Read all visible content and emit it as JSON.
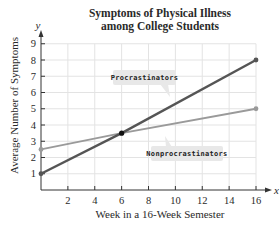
{
  "chart_data": {
    "type": "line",
    "title": "Symptoms of Physical Illness among College Students",
    "title_lines": [
      "Symptoms of Physical Illness",
      "among College Students"
    ],
    "xlabel": "Week in a 16-Week Semester",
    "ylabel": "Average Number of Symptoms",
    "x_axis_var": "x",
    "y_axis_var": "y",
    "xlim": [
      0,
      16
    ],
    "ylim": [
      0,
      9
    ],
    "x_ticks": [
      2,
      4,
      6,
      8,
      10,
      12,
      14,
      16
    ],
    "y_ticks": [
      1,
      2,
      3,
      4,
      5,
      6,
      7,
      8,
      9
    ],
    "grid": true,
    "legend_position": "inline labels",
    "series": [
      {
        "name": "Procrastinators",
        "color": "#555555",
        "x": [
          0,
          6,
          16
        ],
        "y": [
          1,
          3.5,
          8
        ],
        "endpoints": [
          [
            0,
            1
          ],
          [
            16,
            8
          ]
        ]
      },
      {
        "name": "Nonprocrastinators",
        "color": "#9a9a9a",
        "x": [
          0,
          6,
          16
        ],
        "y": [
          2.5,
          3.5,
          5
        ],
        "endpoints": [
          [
            0,
            2.5
          ],
          [
            16,
            5
          ]
        ]
      }
    ],
    "annotations": [
      {
        "type": "intersection-point",
        "x": 6,
        "y": 3.5
      }
    ]
  },
  "labels": {
    "title_line1": "Symptoms of Physical Illness",
    "title_line2": "among College Students",
    "xlabel": "Week in a 16-Week Semester",
    "ylabel": "Average Number of Symptoms",
    "x_var": "x",
    "y_var": "y",
    "procrastinators": "Procrastinators",
    "nonprocrastinators": "Nonprocrastinators"
  },
  "colors": {
    "procrastinators": "#555555",
    "nonprocrastinators": "#9a9a9a",
    "grid": "#e3e3e3",
    "axis": "#333333",
    "label_box": "#e8e8e8"
  }
}
